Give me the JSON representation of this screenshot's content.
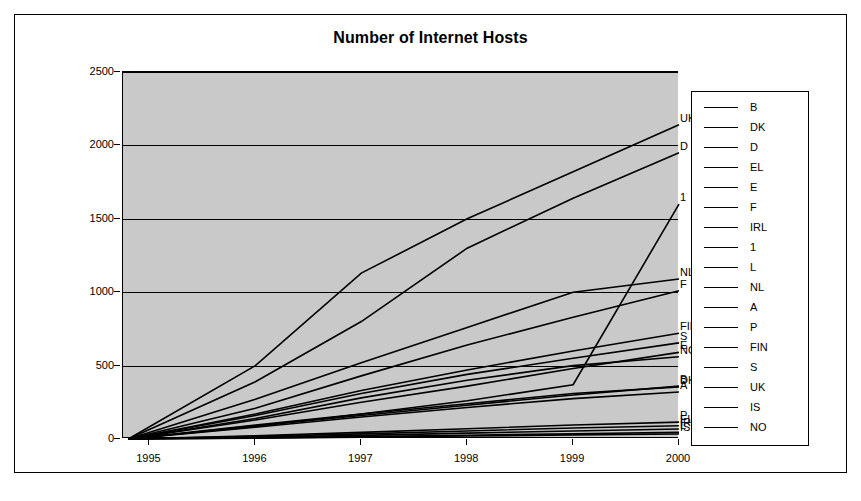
{
  "figure": {
    "title": "Number of Internet Hosts"
  },
  "chart_data": {
    "type": "line",
    "title": "Number of Internet Hosts",
    "xlabel": "",
    "ylabel": "",
    "xlim": [
      1994.75,
      2000.0
    ],
    "ylim": [
      0,
      2500
    ],
    "yticks": [
      0,
      500,
      1000,
      1500,
      2000,
      2500
    ],
    "xticks": [
      1995,
      1996,
      1997,
      1998,
      1999,
      2000
    ],
    "grid": true,
    "legend_position": "right",
    "plot_background": "#c9c9c9",
    "line_color": "#000000",
    "x": [
      1994.8,
      1996,
      1997,
      1998,
      1999,
      2000
    ],
    "series": [
      {
        "name": "B",
        "label": "B",
        "values": [
          0,
          90,
          160,
          230,
          300,
          360
        ]
      },
      {
        "name": "DK",
        "label": "DK",
        "values": [
          0,
          95,
          170,
          240,
          310,
          355
        ]
      },
      {
        "name": "D",
        "label": "D",
        "values": [
          0,
          390,
          800,
          1300,
          1640,
          1950
        ]
      },
      {
        "name": "EL",
        "label": "EL",
        "values": [
          0,
          18,
          35,
          55,
          75,
          90
        ]
      },
      {
        "name": "E",
        "label": "E",
        "values": [
          0,
          130,
          250,
          360,
          480,
          590
        ]
      },
      {
        "name": "F",
        "label": "F",
        "values": [
          0,
          210,
          430,
          640,
          830,
          1010
        ]
      },
      {
        "name": "IRL",
        "label": "IRL",
        "values": [
          0,
          12,
          25,
          40,
          55,
          68
        ]
      },
      {
        "name": "1",
        "label": "1",
        "values": [
          0,
          85,
          170,
          260,
          370,
          1600
        ]
      },
      {
        "name": "L",
        "label": "L",
        "values": [
          0,
          8,
          16,
          26,
          36,
          45
        ]
      },
      {
        "name": "NL",
        "label": "NL",
        "values": [
          0,
          270,
          520,
          760,
          1000,
          1090
        ]
      },
      {
        "name": "A",
        "label": "A",
        "values": [
          0,
          80,
          150,
          215,
          275,
          320
        ]
      },
      {
        "name": "P",
        "label": "P",
        "values": [
          0,
          22,
          45,
          70,
          95,
          115
        ]
      },
      {
        "name": "FIN",
        "label": "FIN",
        "values": [
          0,
          170,
          330,
          470,
          600,
          720
        ]
      },
      {
        "name": "S",
        "label": "S",
        "values": [
          0,
          160,
          310,
          440,
          550,
          655
        ]
      },
      {
        "name": "UK",
        "label": "UK",
        "values": [
          0,
          500,
          1130,
          1500,
          1820,
          2140
        ]
      },
      {
        "name": "IS",
        "label": "IS",
        "values": [
          0,
          6,
          12,
          20,
          28,
          34
        ]
      },
      {
        "name": "NO",
        "label": "NO",
        "values": [
          0,
          140,
          280,
          400,
          500,
          560
        ]
      }
    ],
    "point_labels": [
      {
        "text": "UK",
        "value": 2140
      },
      {
        "text": "D",
        "value": 1950
      },
      {
        "text": "1",
        "value": 1600
      },
      {
        "text": "NL",
        "value": 1090
      },
      {
        "text": "F",
        "value": 1010
      },
      {
        "text": "FIN",
        "value": 720
      },
      {
        "text": "S",
        "value": 655
      },
      {
        "text": "E",
        "value": 590
      },
      {
        "text": "NO",
        "value": 560
      },
      {
        "text": "B",
        "value": 360
      },
      {
        "text": "DK",
        "value": 355
      },
      {
        "text": "A",
        "value": 320
      },
      {
        "text": "P",
        "value": 115
      },
      {
        "text": "EL",
        "value": 90
      },
      {
        "text": "IRL",
        "value": 68
      },
      {
        "text": "IS",
        "value": 34
      },
      {
        "text": "L",
        "value": 45
      }
    ]
  },
  "axes": {
    "y_tick_labels": [
      "2500",
      "2000",
      "1500",
      "1000",
      "500",
      "0"
    ],
    "x_tick_labels": [
      "1995",
      "1996",
      "1997",
      "1998",
      "1999",
      "2000"
    ]
  },
  "legend": {
    "items": [
      {
        "label": "B"
      },
      {
        "label": "DK"
      },
      {
        "label": "D"
      },
      {
        "label": "EL"
      },
      {
        "label": "E"
      },
      {
        "label": "F"
      },
      {
        "label": "IRL"
      },
      {
        "label": "1"
      },
      {
        "label": "L"
      },
      {
        "label": "NL"
      },
      {
        "label": "A"
      },
      {
        "label": "P"
      },
      {
        "label": "FIN"
      },
      {
        "label": "S"
      },
      {
        "label": "UK"
      },
      {
        "label": "IS"
      },
      {
        "label": "NO"
      }
    ]
  }
}
